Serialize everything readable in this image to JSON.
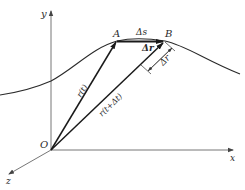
{
  "diagram": {
    "type": "kinematics-position-vectors",
    "axes": {
      "x_label": "x",
      "y_label": "y",
      "z_label": "z",
      "origin_label": "O"
    },
    "points": {
      "A": "A",
      "B": "B"
    },
    "vectors": {
      "r_t": "r(t)",
      "r_t_dt": "r(t+Δt)",
      "delta_r_vec": "Δr"
    },
    "annotations": {
      "arc_length": "Δs",
      "delta_r_magnitude": "Δr"
    },
    "colors": {
      "stroke": "#2a2a2a",
      "axis": "#555555",
      "background": "#ffffff"
    }
  }
}
